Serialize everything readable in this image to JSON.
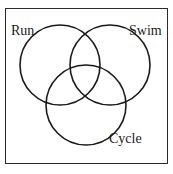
{
  "figure": {
    "type": "venn-diagram",
    "title": "",
    "set_count": 3,
    "background_color": "#ffffff",
    "stroke_color": "#1a1a1a",
    "frame_color": "#2b2b2b",
    "text_color": "#1a1a1a"
  },
  "chart_data": {
    "type": "diagram",
    "diagram_type": "venn",
    "title": "",
    "xlabel": "",
    "ylabel": "",
    "grid": false,
    "legend": "none",
    "sets": [
      {
        "label": "Run",
        "name": "run-set",
        "cx": 60,
        "cy": 65,
        "r": 40,
        "label_x": 11,
        "label_y": 24
      },
      {
        "label": "Swim",
        "name": "swim-set",
        "cx": 110,
        "cy": 65,
        "r": 40,
        "label_x": 129,
        "label_y": 24
      },
      {
        "label": "Cycle",
        "name": "cycle-set",
        "cx": 86,
        "cy": 105,
        "r": 40,
        "label_x": 109,
        "label_y": 132
      }
    ],
    "region_values": [],
    "annotations": []
  },
  "labels": {
    "run": "Run",
    "swim": "Swim",
    "cycle": "Cycle"
  }
}
